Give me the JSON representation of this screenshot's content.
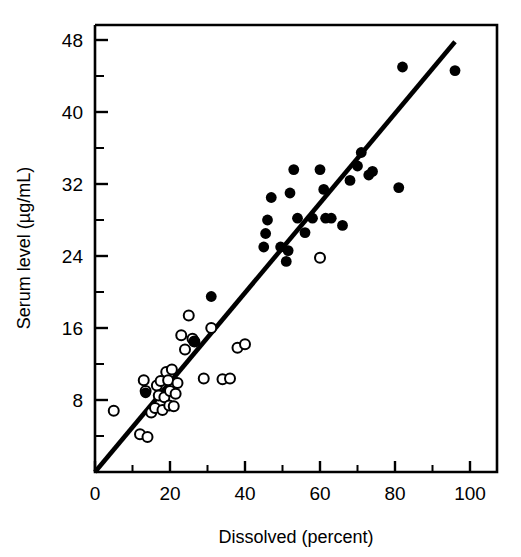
{
  "chart_data": {
    "type": "scatter",
    "title": "",
    "xlabel": "Dissolved (percent)",
    "ylabel": "Serum level (µg/mL)",
    "xlim": [
      0,
      102
    ],
    "ylim": [
      0,
      50
    ],
    "grid": false,
    "legend": "none",
    "x_ticks_major": [
      0,
      20,
      40,
      60,
      80,
      100
    ],
    "x_ticks_major_labels": [
      "0",
      "20",
      "40",
      "60",
      "80",
      "100"
    ],
    "x_ticks_minor": [
      10,
      30,
      50,
      70,
      90
    ],
    "y_ticks_major": [
      8,
      16,
      24,
      32,
      40,
      48
    ],
    "y_ticks_major_labels": [
      "8",
      "16",
      "24",
      "32",
      "40",
      "48"
    ],
    "y_ticks_minor": [
      4,
      12,
      20,
      28,
      36,
      44
    ],
    "series": [
      {
        "name": "open-circles",
        "marker": "open-circle",
        "color": "#000000",
        "points": [
          [
            5,
            6.8
          ],
          [
            12,
            4.2
          ],
          [
            13,
            10.2
          ],
          [
            13.5,
            9.0
          ],
          [
            14,
            3.9
          ],
          [
            15,
            6.6
          ],
          [
            16,
            7.1
          ],
          [
            16.5,
            9.6
          ],
          [
            17,
            8.5
          ],
          [
            17.5,
            10.1
          ],
          [
            18,
            6.9
          ],
          [
            18.5,
            8.3
          ],
          [
            19,
            11.1
          ],
          [
            19.5,
            10.2
          ],
          [
            19.8,
            7.4
          ],
          [
            20,
            9.0
          ],
          [
            20.5,
            11.4
          ],
          [
            21,
            7.3
          ],
          [
            21.5,
            8.7
          ],
          [
            22,
            9.9
          ],
          [
            23,
            15.2
          ],
          [
            24,
            13.6
          ],
          [
            25,
            17.4
          ],
          [
            26,
            14.8
          ],
          [
            26.5,
            14.5
          ],
          [
            29,
            10.4
          ],
          [
            31,
            16.0
          ],
          [
            34,
            10.3
          ],
          [
            36,
            10.4
          ],
          [
            38,
            13.8
          ],
          [
            40,
            14.2
          ],
          [
            60,
            23.8
          ]
        ]
      },
      {
        "name": "filled-circles",
        "marker": "filled-circle",
        "color": "#000000",
        "points": [
          [
            13.5,
            8.8
          ],
          [
            26.5,
            14.5
          ],
          [
            31,
            19.5
          ],
          [
            45,
            25.0
          ],
          [
            45.5,
            26.5
          ],
          [
            46,
            28.0
          ],
          [
            47,
            30.5
          ],
          [
            49.5,
            25.0
          ],
          [
            51,
            23.4
          ],
          [
            51.5,
            24.6
          ],
          [
            52,
            31.0
          ],
          [
            53,
            33.6
          ],
          [
            54,
            28.2
          ],
          [
            56,
            26.6
          ],
          [
            58,
            28.2
          ],
          [
            60,
            33.6
          ],
          [
            61,
            31.4
          ],
          [
            61.5,
            28.2
          ],
          [
            63,
            28.2
          ],
          [
            66,
            27.4
          ],
          [
            68,
            32.4
          ],
          [
            70,
            34.0
          ],
          [
            71,
            35.5
          ],
          [
            73,
            33.0
          ],
          [
            74,
            33.4
          ],
          [
            81,
            31.6
          ],
          [
            82,
            45.0
          ],
          [
            96,
            44.6
          ]
        ]
      }
    ],
    "fit_line": {
      "name": "regression-line",
      "from": [
        0,
        0
      ],
      "to": [
        96,
        47.8
      ],
      "slope": 0.498,
      "intercept": 0
    }
  },
  "axis": {
    "x_title": "Dissolved (percent)",
    "y_title": "Serum level (µg/mL)"
  }
}
